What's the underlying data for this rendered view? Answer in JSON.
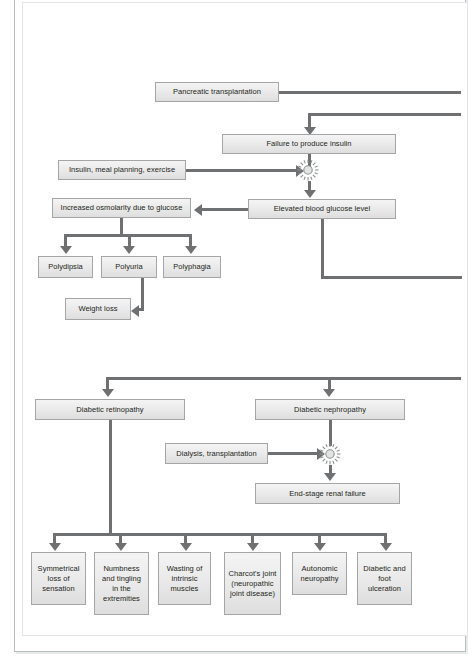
{
  "figure": {
    "type": "flowchart",
    "accent_color": "#6e7071",
    "node_fill": "#e9e9e9",
    "node_border": "#a3a5a6",
    "text_color": "#231f20"
  },
  "nodes": {
    "pancreatic_transplantation": "Pancreatic transplantation",
    "failure_to_produce_insulin": "Failure to produce insulin",
    "insulin_meal_planning_exercise": "Insulin, meal planning, exercise",
    "elevated_blood_glucose_level": "Elevated blood glucose level",
    "increased_osmolarity": "Increased osmolarity due to glucose",
    "polydipsia": "Polydipsia",
    "polyuria": "Polyuria",
    "polyphagia": "Polyphagia",
    "weight_loss": "Weight loss",
    "diabetic_retinopathy": "Diabetic retinopathy",
    "diabetic_nephropathy": "Diabetic nephropathy",
    "dialysis_transplantation": "Dialysis, transplantation",
    "end_stage_renal_failure": "End-stage renal failure",
    "symmetrical_loss_of_sensation": "Symmetrical loss of sensation",
    "numbness_and_tingling": "Numbness and tingling in the extremities",
    "wasting_of_intrinsic_muscles": "Wasting of intrinsic muscles",
    "charcots_joint": "Charcot's joint (neuropathic joint disease)",
    "autonomic_neuropathy": "Autonomic neuropathy",
    "diabetic_foot_ulceration": "Diabetic and foot ulceration"
  },
  "icons": {
    "burst_block": "starburst-block-icon"
  }
}
